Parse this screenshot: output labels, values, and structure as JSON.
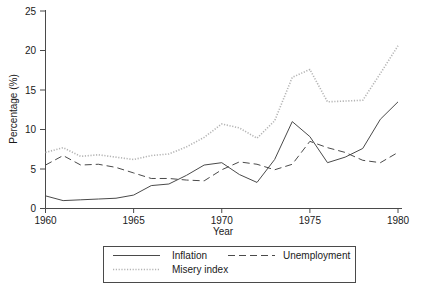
{
  "chart_data": {
    "type": "line",
    "title": "",
    "xlabel": "Year",
    "ylabel": "Percentage (%)",
    "x": [
      1960,
      1961,
      1962,
      1963,
      1964,
      1965,
      1966,
      1967,
      1968,
      1969,
      1970,
      1971,
      1972,
      1973,
      1974,
      1975,
      1976,
      1977,
      1978,
      1979,
      1980
    ],
    "xlim": [
      1960,
      1980
    ],
    "ylim": [
      0,
      25
    ],
    "xticks": [
      1960,
      1965,
      1970,
      1975,
      1980
    ],
    "yticks": [
      0,
      5,
      10,
      15,
      20,
      25
    ],
    "xtick_labels": [
      "1960",
      "1965",
      "1970",
      "1975",
      "1980"
    ],
    "ytick_labels": [
      "0",
      "5",
      "10",
      "15",
      "20",
      "25"
    ],
    "grid": false,
    "legend_position": "below-axes",
    "series": [
      {
        "name": "Inflation",
        "style": "solid",
        "color": "#4a4a4a",
        "values": [
          1.6,
          1.0,
          1.1,
          1.2,
          1.3,
          1.7,
          2.9,
          3.1,
          4.2,
          5.5,
          5.8,
          4.3,
          3.3,
          6.2,
          11.0,
          9.1,
          5.8,
          6.5,
          7.6,
          11.3,
          13.5
        ]
      },
      {
        "name": "Unemployment",
        "style": "dashed",
        "color": "#4a4a4a",
        "values": [
          5.5,
          6.7,
          5.5,
          5.6,
          5.2,
          4.5,
          3.8,
          3.8,
          3.6,
          3.5,
          4.9,
          5.9,
          5.6,
          4.9,
          5.6,
          8.5,
          7.7,
          7.1,
          6.1,
          5.8,
          7.1
        ]
      },
      {
        "name": "Misery index",
        "style": "dotted",
        "color": "#b4b4b4",
        "values": [
          7.1,
          7.7,
          6.6,
          6.8,
          6.5,
          6.2,
          6.7,
          6.9,
          7.8,
          9.0,
          10.7,
          10.2,
          8.9,
          11.1,
          16.6,
          17.6,
          13.5,
          13.6,
          13.7,
          17.1,
          20.6
        ]
      }
    ]
  },
  "legend": {
    "entries": [
      {
        "label": "Inflation"
      },
      {
        "label": "Unemployment"
      },
      {
        "label": "Misery index"
      }
    ]
  }
}
